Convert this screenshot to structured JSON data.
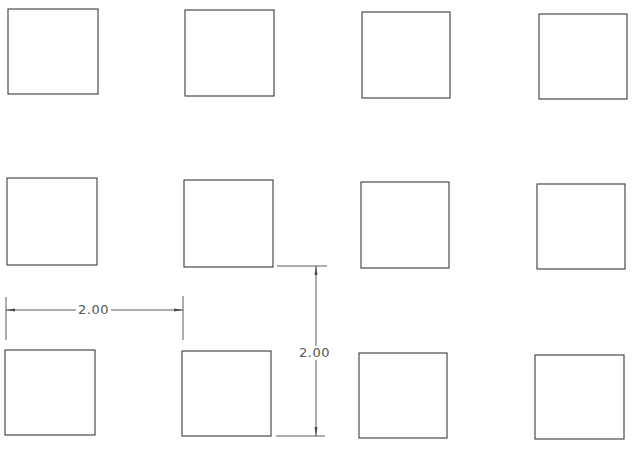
{
  "drawing": {
    "type": "cad-square-grid",
    "rows": 3,
    "cols": 4,
    "stroke_color": "#3a3a3a",
    "squares": [
      {
        "row": 1,
        "col": 1,
        "x": 8,
        "y": 9,
        "w": 90,
        "h": 85
      },
      {
        "row": 1,
        "col": 2,
        "x": 185,
        "y": 10,
        "w": 89,
        "h": 86
      },
      {
        "row": 1,
        "col": 3,
        "x": 362,
        "y": 12,
        "w": 88,
        "h": 86
      },
      {
        "row": 1,
        "col": 4,
        "x": 539,
        "y": 14,
        "w": 88,
        "h": 85
      },
      {
        "row": 2,
        "col": 1,
        "x": 7,
        "y": 178,
        "w": 90,
        "h": 87
      },
      {
        "row": 2,
        "col": 2,
        "x": 184,
        "y": 180,
        "w": 89,
        "h": 87
      },
      {
        "row": 2,
        "col": 3,
        "x": 361,
        "y": 182,
        "w": 88,
        "h": 86
      },
      {
        "row": 2,
        "col": 4,
        "x": 537,
        "y": 184,
        "w": 88,
        "h": 85
      },
      {
        "row": 3,
        "col": 1,
        "x": 5,
        "y": 350,
        "w": 90,
        "h": 85
      },
      {
        "row": 3,
        "col": 2,
        "x": 182,
        "y": 351,
        "w": 89,
        "h": 85
      },
      {
        "row": 3,
        "col": 3,
        "x": 359,
        "y": 353,
        "w": 88,
        "h": 85
      },
      {
        "row": 3,
        "col": 4,
        "x": 535,
        "y": 355,
        "w": 89,
        "h": 84
      }
    ]
  },
  "dimensions": {
    "horizontal": {
      "label": "2.00",
      "orientation": "horizontal",
      "description": "column spacing"
    },
    "vertical": {
      "label": "2.00",
      "orientation": "vertical",
      "description": "row spacing"
    }
  }
}
